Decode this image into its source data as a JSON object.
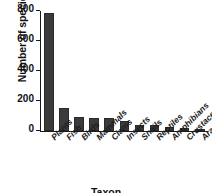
{
  "chart_data": {
    "type": "bar",
    "title": "",
    "xlabel": "Taxon",
    "ylabel": "Number of species",
    "categories": [
      "Plants",
      "Fish",
      "Birds",
      "Mammals",
      "Clams",
      "Insects",
      "Snails",
      "Reptiles",
      "Amphibians",
      "Crustaceans",
      "Arachnids"
    ],
    "values": [
      785,
      153,
      93,
      87,
      86,
      65,
      42,
      37,
      27,
      23,
      13
    ],
    "ylim": [
      0,
      800
    ],
    "yticks": [
      0,
      200,
      400,
      600,
      800
    ],
    "ytick_labels": [
      "0",
      "200",
      "400",
      "600",
      "800"
    ],
    "grid": false,
    "legend": null,
    "bar_color": "#3b3b3b",
    "axis_color": "#1a1a1a"
  },
  "axes": {
    "y_title": "Number of species",
    "x_title": "Taxon"
  }
}
